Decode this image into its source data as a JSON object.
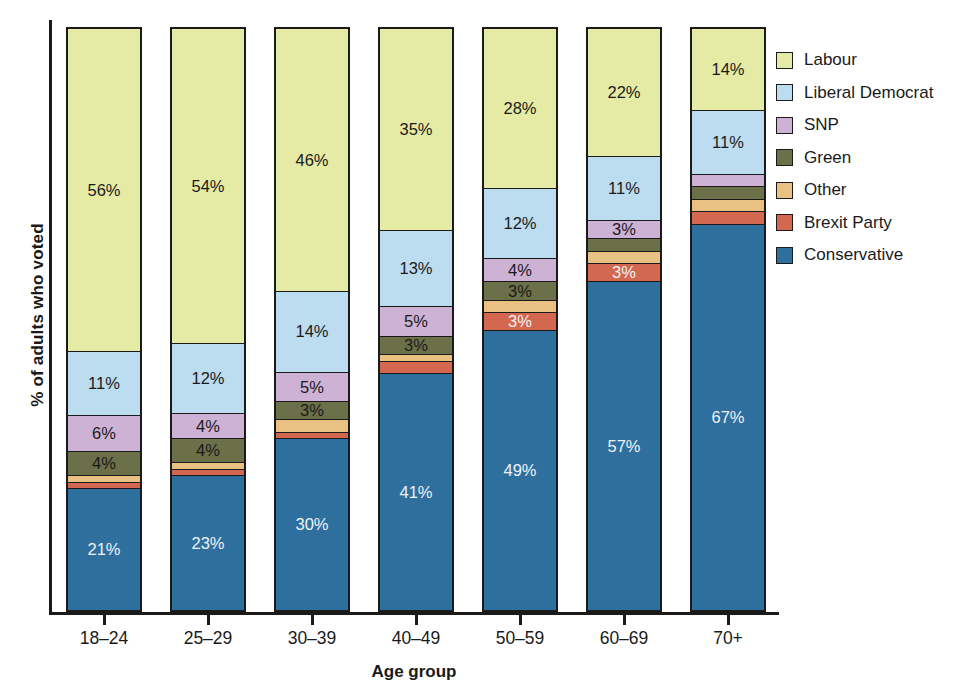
{
  "chart_data": {
    "type": "bar",
    "subtype": "stacked-bar-100-percent",
    "title": "",
    "xlabel": "Age group",
    "ylabel": "% of adults who voted",
    "ylim": [
      0,
      100
    ],
    "grid": false,
    "legend_position": "right",
    "stacked_order_bottom_to_top": [
      "Conservative",
      "Brexit Party",
      "Other",
      "Green",
      "SNP",
      "Liberal Democrat",
      "Labour"
    ],
    "categories": [
      "18–24",
      "25–29",
      "30–39",
      "40–49",
      "50–59",
      "60–69",
      "70+"
    ],
    "series": [
      {
        "name": "Conservative",
        "color": "#2f6f9e",
        "values": [
          21,
          23,
          30,
          41,
          49,
          57,
          67
        ],
        "labels": [
          "21%",
          "23%",
          "30%",
          "41%",
          "49%",
          "57%",
          "67%"
        ],
        "label_color": "light"
      },
      {
        "name": "Brexit Party",
        "color": "#d4674f",
        "values": [
          1,
          1,
          1,
          2,
          3,
          3,
          2
        ],
        "labels": [
          "",
          "",
          "",
          "",
          "3%",
          "3%",
          ""
        ],
        "label_color": "light"
      },
      {
        "name": "Other",
        "color": "#e9c182",
        "values": [
          1,
          1,
          2,
          1,
          2,
          2,
          2
        ],
        "labels": [
          "",
          "",
          "",
          "",
          "",
          "",
          ""
        ],
        "label_color": "dark"
      },
      {
        "name": "Green",
        "color": "#6b7048",
        "values": [
          4,
          4,
          3,
          3,
          3,
          2,
          2
        ],
        "labels": [
          "4%",
          "4%",
          "3%",
          "3%",
          "3%",
          "",
          ""
        ],
        "label_color": "dark"
      },
      {
        "name": "SNP",
        "color": "#ceb2d6",
        "values": [
          6,
          4,
          5,
          5,
          4,
          3,
          2
        ],
        "labels": [
          "6%",
          "4%",
          "5%",
          "5%",
          "4%",
          "3%",
          ""
        ],
        "label_color": "dark"
      },
      {
        "name": "Liberal Democrat",
        "color": "#bcdcef",
        "values": [
          11,
          12,
          14,
          13,
          12,
          11,
          11
        ],
        "labels": [
          "11%",
          "12%",
          "14%",
          "13%",
          "12%",
          "11%",
          "11%"
        ],
        "label_color": "dark"
      },
      {
        "name": "Labour",
        "color": "#e5eaa5",
        "values": [
          56,
          54,
          46,
          35,
          28,
          22,
          14
        ],
        "labels": [
          "56%",
          "54%",
          "46%",
          "35%",
          "28%",
          "22%",
          "14%"
        ],
        "label_color": "dark"
      }
    ]
  },
  "axes": {
    "x_title": "Age group",
    "y_title": "% of adults who voted"
  },
  "legend": {
    "items": [
      {
        "label": "Labour",
        "color": "#e5eaa5"
      },
      {
        "label": "Liberal Democrat",
        "color": "#bcdcef"
      },
      {
        "label": "SNP",
        "color": "#ceb2d6"
      },
      {
        "label": "Green",
        "color": "#6b7048"
      },
      {
        "label": "Other",
        "color": "#e9c182"
      },
      {
        "label": "Brexit Party",
        "color": "#d4674f"
      },
      {
        "label": "Conservative",
        "color": "#2f6f9e"
      }
    ]
  },
  "colors": {
    "axis": "#1a1a1a",
    "background": "#ffffff",
    "label_light": "#eef2f5",
    "label_dark": "#1a1a1a"
  }
}
